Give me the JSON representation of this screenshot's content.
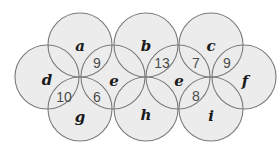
{
  "diagram": {
    "type": "overlapping-circles-puzzle",
    "colors": {
      "fill": "#ececec",
      "stroke": "#7a7a7a",
      "text": "#222222"
    },
    "circles": [
      {
        "id": "a",
        "label": "a",
        "cx": 80,
        "cy": 45,
        "r": 32
      },
      {
        "id": "b",
        "label": "b",
        "cx": 146,
        "cy": 45,
        "r": 32
      },
      {
        "id": "c",
        "label": "c",
        "cx": 211,
        "cy": 45,
        "r": 32
      },
      {
        "id": "d",
        "label": "d",
        "cx": 47,
        "cy": 77,
        "r": 32
      },
      {
        "id": "e1",
        "label": "e",
        "cx": 113,
        "cy": 77,
        "r": 32
      },
      {
        "id": "e2",
        "label": "e",
        "cx": 178,
        "cy": 77,
        "r": 32
      },
      {
        "id": "f",
        "label": "f",
        "cx": 244,
        "cy": 77,
        "r": 32
      },
      {
        "id": "g",
        "label": "g",
        "cx": 80,
        "cy": 109,
        "r": 32
      },
      {
        "id": "h",
        "label": "h",
        "cx": 146,
        "cy": 109,
        "r": 32
      },
      {
        "id": "i",
        "label": "i",
        "cx": 211,
        "cy": 109,
        "r": 32
      }
    ],
    "variable_labels": [
      {
        "text": "a",
        "x": 80,
        "y": 46
      },
      {
        "text": "b",
        "x": 146,
        "y": 46
      },
      {
        "text": "c",
        "x": 211,
        "y": 46
      },
      {
        "text": "d",
        "x": 47,
        "y": 80
      },
      {
        "text": "e",
        "x": 114,
        "y": 81
      },
      {
        "text": "e",
        "x": 179,
        "y": 81
      },
      {
        "text": "f",
        "x": 245,
        "y": 81
      },
      {
        "text": "g",
        "x": 80,
        "y": 117
      },
      {
        "text": "h",
        "x": 146,
        "y": 115
      },
      {
        "text": "i",
        "x": 211,
        "y": 116
      }
    ],
    "intersection_values": [
      {
        "text": "9",
        "between": [
          "a",
          "e"
        ],
        "x": 97,
        "y": 63
      },
      {
        "text": "13",
        "between": [
          "b",
          "e"
        ],
        "x": 162,
        "y": 63
      },
      {
        "text": "7",
        "between": [
          "c",
          "e"
        ],
        "x": 196,
        "y": 63
      },
      {
        "text": "9",
        "between": [
          "c",
          "f"
        ],
        "x": 227,
        "y": 63
      },
      {
        "text": "10",
        "between": [
          "d",
          "g"
        ],
        "x": 64,
        "y": 97
      },
      {
        "text": "6",
        "between": [
          "e",
          "g"
        ],
        "x": 97,
        "y": 97
      },
      {
        "text": "8",
        "between": [
          "e",
          "i"
        ],
        "x": 196,
        "y": 96
      }
    ]
  }
}
